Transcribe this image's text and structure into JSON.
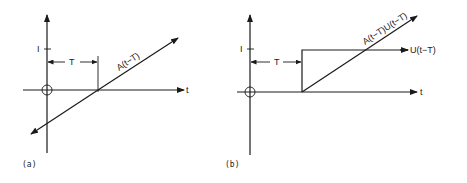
{
  "panels": [
    {
      "id": "a",
      "caption": "(a)",
      "y_tick_label": "I",
      "interval_label": "T",
      "x_axis_label": "t",
      "curve_label": "A(t−T)",
      "description": "Ramp A(t−T) crossing zero at t=T, extending for all t"
    },
    {
      "id": "b",
      "caption": "(b)",
      "y_tick_label": "I",
      "interval_label": "T",
      "x_axis_label": "t",
      "curve_label": "A(t−T)U(t−T)",
      "step_label": "U(t−T)",
      "description": "Ramp starting at t=T (truncated by unit step) and unit step U(t−T) of height 1"
    }
  ],
  "colors": {
    "ink": "#1a1a1a",
    "background": "#ffffff"
  }
}
